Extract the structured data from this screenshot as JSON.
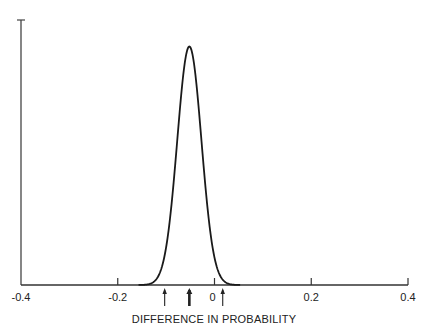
{
  "chart_data": {
    "type": "line",
    "title": "",
    "xlabel": "DIFFERENCE IN PROBABILITY",
    "ylabel": "",
    "xlim": [
      -0.4,
      0.4
    ],
    "ylim": [
      0,
      1
    ],
    "grid": false,
    "legend": null,
    "xticks": [
      -0.4,
      -0.2,
      0,
      0.2,
      0.4
    ],
    "xtick_labels": [
      "-0.4",
      "-0.2",
      "0",
      "0.2",
      "0.4"
    ],
    "series": [
      {
        "name": "posterior density",
        "distribution": "normal",
        "mean": -0.052,
        "sd": 0.025,
        "peak_relative_height": 0.9
      }
    ],
    "annotations": [
      {
        "type": "arrow",
        "x": -0.103,
        "label": "lower bound",
        "weight": "thin"
      },
      {
        "type": "arrow",
        "x": -0.052,
        "label": "mean",
        "weight": "thick"
      },
      {
        "type": "arrow",
        "x": 0.017,
        "label": "upper bound",
        "weight": "thin"
      }
    ]
  },
  "axis": {
    "x_title": "DIFFERENCE IN PROBABILITY"
  },
  "colors": {
    "line": "#1a1a1a",
    "axis": "#333333",
    "background": "#ffffff"
  }
}
